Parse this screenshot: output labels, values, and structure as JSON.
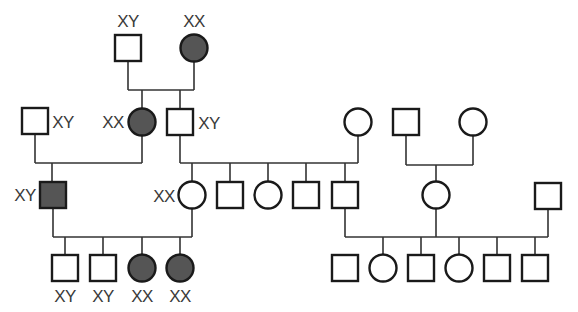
{
  "diagram": {
    "type": "pedigree",
    "colors": {
      "affected_fill": "#555555",
      "unaffected_fill": "#ffffff",
      "stroke": "#1a1a1a",
      "line": "#333333",
      "label": "#3a3a3a"
    },
    "individuals": [
      {
        "id": "I-1",
        "gen": 1,
        "sex": "male",
        "affected": false,
        "x": 128,
        "y": 48,
        "label": "XY",
        "label_pos": "above"
      },
      {
        "id": "I-2",
        "gen": 1,
        "sex": "female",
        "affected": true,
        "x": 194,
        "y": 48,
        "label": "XX",
        "label_pos": "above"
      },
      {
        "id": "II-1",
        "gen": 2,
        "sex": "male",
        "affected": false,
        "x": 35,
        "y": 121,
        "label": "XY",
        "label_pos": "right"
      },
      {
        "id": "II-2",
        "gen": 2,
        "sex": "female",
        "affected": true,
        "x": 142,
        "y": 122,
        "label": "XX",
        "label_pos": "left"
      },
      {
        "id": "II-3",
        "gen": 2,
        "sex": "male",
        "affected": false,
        "x": 180,
        "y": 122,
        "label": "XY",
        "label_pos": "right"
      },
      {
        "id": "II-4",
        "gen": 2,
        "sex": "female",
        "affected": false,
        "x": 358,
        "y": 122,
        "label": ""
      },
      {
        "id": "II-5",
        "gen": 2,
        "sex": "male",
        "affected": false,
        "x": 406,
        "y": 122,
        "label": ""
      },
      {
        "id": "II-6",
        "gen": 2,
        "sex": "female",
        "affected": false,
        "x": 473,
        "y": 122,
        "label": ""
      },
      {
        "id": "III-1",
        "gen": 3,
        "sex": "male",
        "affected": true,
        "x": 53,
        "y": 195,
        "label": "XY",
        "label_pos": "left"
      },
      {
        "id": "III-2",
        "gen": 3,
        "sex": "female",
        "affected": false,
        "x": 192,
        "y": 195,
        "label": "XX",
        "label_pos": "left"
      },
      {
        "id": "III-3",
        "gen": 3,
        "sex": "male",
        "affected": false,
        "x": 230,
        "y": 195,
        "label": ""
      },
      {
        "id": "III-4",
        "gen": 3,
        "sex": "female",
        "affected": false,
        "x": 268,
        "y": 195,
        "label": ""
      },
      {
        "id": "III-5",
        "gen": 3,
        "sex": "male",
        "affected": false,
        "x": 306,
        "y": 195,
        "label": ""
      },
      {
        "id": "III-6",
        "gen": 3,
        "sex": "male",
        "affected": false,
        "x": 345,
        "y": 195,
        "label": ""
      },
      {
        "id": "III-7",
        "gen": 3,
        "sex": "female",
        "affected": false,
        "x": 436,
        "y": 195,
        "label": ""
      },
      {
        "id": "III-8",
        "gen": 3,
        "sex": "male",
        "affected": false,
        "x": 548,
        "y": 196,
        "label": ""
      },
      {
        "id": "IV-1",
        "gen": 4,
        "sex": "male",
        "affected": false,
        "x": 65,
        "y": 268,
        "label": "XY",
        "label_pos": "below"
      },
      {
        "id": "IV-2",
        "gen": 4,
        "sex": "male",
        "affected": false,
        "x": 103,
        "y": 268,
        "label": "XY",
        "label_pos": "below"
      },
      {
        "id": "IV-3",
        "gen": 4,
        "sex": "female",
        "affected": true,
        "x": 142,
        "y": 268,
        "label": "XX",
        "label_pos": "below"
      },
      {
        "id": "IV-4",
        "gen": 4,
        "sex": "female",
        "affected": true,
        "x": 180,
        "y": 268,
        "label": "XX",
        "label_pos": "below"
      },
      {
        "id": "IV-5",
        "gen": 4,
        "sex": "male",
        "affected": false,
        "x": 345,
        "y": 268,
        "label": ""
      },
      {
        "id": "IV-6",
        "gen": 4,
        "sex": "female",
        "affected": false,
        "x": 383,
        "y": 268,
        "label": ""
      },
      {
        "id": "IV-7",
        "gen": 4,
        "sex": "male",
        "affected": false,
        "x": 421,
        "y": 268,
        "label": ""
      },
      {
        "id": "IV-8",
        "gen": 4,
        "sex": "female",
        "affected": false,
        "x": 459,
        "y": 268,
        "label": ""
      },
      {
        "id": "IV-9",
        "gen": 4,
        "sex": "male",
        "affected": false,
        "x": 497,
        "y": 268,
        "label": ""
      },
      {
        "id": "IV-10",
        "gen": 4,
        "sex": "male",
        "affected": false,
        "x": 535,
        "y": 268,
        "label": ""
      }
    ],
    "lines": [
      [
        128,
        62,
        128,
        90
      ],
      [
        194,
        62,
        194,
        90
      ],
      [
        128,
        90,
        194,
        90
      ],
      [
        142,
        90,
        142,
        108
      ],
      [
        180,
        90,
        180,
        108
      ],
      [
        35,
        135,
        35,
        163
      ],
      [
        142,
        136,
        142,
        163
      ],
      [
        35,
        163,
        142,
        163
      ],
      [
        52,
        163,
        52,
        181
      ],
      [
        180,
        136,
        180,
        163
      ],
      [
        358,
        136,
        358,
        163
      ],
      [
        180,
        163,
        358,
        163
      ],
      [
        192,
        163,
        192,
        181
      ],
      [
        230,
        163,
        230,
        181
      ],
      [
        268,
        163,
        268,
        181
      ],
      [
        306,
        163,
        306,
        181
      ],
      [
        345,
        163,
        345,
        181
      ],
      [
        406,
        136,
        406,
        165
      ],
      [
        473,
        136,
        473,
        165
      ],
      [
        406,
        165,
        473,
        165
      ],
      [
        436,
        165,
        436,
        181
      ],
      [
        53,
        209,
        53,
        237
      ],
      [
        192,
        209,
        192,
        237
      ],
      [
        53,
        237,
        192,
        237
      ],
      [
        65,
        237,
        65,
        254
      ],
      [
        103,
        237,
        103,
        254
      ],
      [
        142,
        237,
        142,
        254
      ],
      [
        180,
        237,
        180,
        254
      ],
      [
        345,
        209,
        345,
        237
      ],
      [
        436,
        209,
        436,
        237
      ],
      [
        548,
        210,
        548,
        237
      ],
      [
        345,
        237,
        548,
        237
      ],
      [
        383,
        237,
        383,
        254
      ],
      [
        421,
        237,
        421,
        254
      ],
      [
        459,
        237,
        459,
        254
      ],
      [
        497,
        237,
        497,
        254
      ],
      [
        535,
        237,
        535,
        254
      ]
    ],
    "labels": [
      {
        "text": "XY",
        "x": 128,
        "y": 21
      },
      {
        "text": "XX",
        "x": 194,
        "y": 21
      },
      {
        "text": "XY",
        "x": 63,
        "y": 122
      },
      {
        "text": "XX",
        "x": 113,
        "y": 122
      },
      {
        "text": "XY",
        "x": 209,
        "y": 123
      },
      {
        "text": "XY",
        "x": 25,
        "y": 195
      },
      {
        "text": "XX",
        "x": 164,
        "y": 196
      },
      {
        "text": "XY",
        "x": 65,
        "y": 296
      },
      {
        "text": "XY",
        "x": 103,
        "y": 296
      },
      {
        "text": "XX",
        "x": 142,
        "y": 296
      },
      {
        "text": "XX",
        "x": 180,
        "y": 296
      }
    ]
  }
}
